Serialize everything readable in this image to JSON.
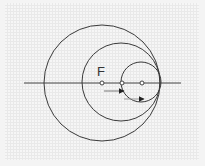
{
  "diagram": {
    "type": "nested tangent circles",
    "label_focus": "F",
    "colors": {
      "stroke": "#3a3a3a",
      "axis": "#444444",
      "arrow_line": "#777777",
      "arrowhead": "#222222",
      "dot_fill": "#ffffff"
    },
    "axis": {
      "x1": 24,
      "x2": 181,
      "y": 83
    },
    "circles": [
      {
        "name": "outer",
        "cx": 102,
        "cy": 83,
        "r": 58
      },
      {
        "name": "middle",
        "cx": 121,
        "cy": 82,
        "r": 39
      },
      {
        "name": "inner",
        "cx": 141,
        "cy": 82,
        "r": 20
      }
    ],
    "points": [
      {
        "name": "F",
        "x": 102,
        "y": 83
      },
      {
        "name": "middle-center",
        "x": 122,
        "y": 83
      },
      {
        "name": "inner-center",
        "x": 142,
        "y": 83
      }
    ]
  }
}
